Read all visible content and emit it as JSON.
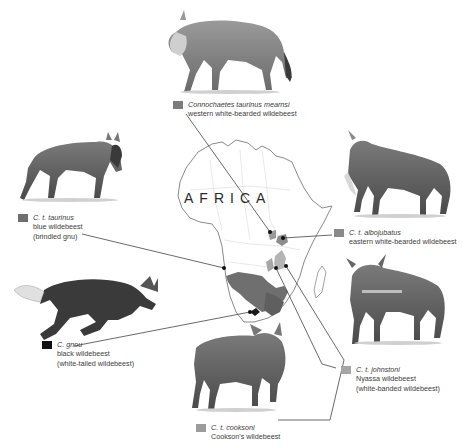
{
  "map": {
    "label": "AFRICA",
    "outline_color": "#8a8a8a",
    "range_colors": {
      "blue_wildebeest": "#6f6f6f",
      "black_wildebeest": "#1a1a1a",
      "nyassa": "#b4b4b4",
      "eastern_white_bearded": "#8c8c8c",
      "western_white_bearded": "#9a9a9a",
      "cooksons": "#a6a6a6"
    }
  },
  "subspecies": [
    {
      "id": "mearnsi",
      "scientific": "Connochaetes taurinus mearnsi",
      "common": [
        "western white-bearded wildebeest"
      ],
      "swatch": "#7c7c7c",
      "illustration": "wildebeest-walking-icon"
    },
    {
      "id": "taurinus",
      "scientific": "C. t. taurinus",
      "common": [
        "blue wildebeest",
        "(brindled gnu)"
      ],
      "swatch": "#6e6e6e",
      "illustration": "wildebeest-walking-icon"
    },
    {
      "id": "albojubatus",
      "scientific": "C. t. albojubatus",
      "common": [
        "eastern white-bearded wildebeest"
      ],
      "swatch": "#8a8a8a",
      "illustration": "wildebeest-standing-icon"
    },
    {
      "id": "gnou",
      "scientific": "C. gnou",
      "common": [
        "black wildebeest",
        "(white-tailed wildebeest)"
      ],
      "swatch": "#111111",
      "illustration": "wildebeest-running-icon"
    },
    {
      "id": "johnstoni",
      "scientific": "C. t. johnstoni",
      "common": [
        "Nyassa wildebeest",
        "(white-banded wildebeest)"
      ],
      "swatch": "#a5a5a5",
      "illustration": "wildebeest-standing-icon"
    },
    {
      "id": "cooksoni",
      "scientific": "C. t. cooksoni",
      "common": [
        "Cookson's wildebeest"
      ],
      "swatch": "#9c9c9c",
      "illustration": "wildebeest-standing-icon"
    }
  ]
}
